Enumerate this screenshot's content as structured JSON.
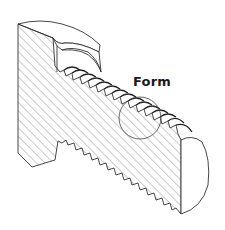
{
  "diagram": {
    "callout": {
      "label": "Form",
      "position": {
        "x": 133,
        "y": 74
      },
      "circle": {
        "cx": 140,
        "cy": 118,
        "r": 21
      }
    },
    "colors": {
      "line": "#333333",
      "hatch": "#555555",
      "background": "#ffffff"
    }
  }
}
